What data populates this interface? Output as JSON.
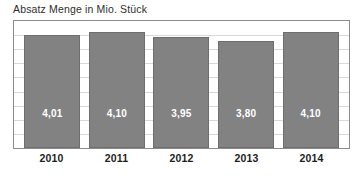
{
  "chart_data": {
    "type": "bar",
    "title": "Absatz Menge in Mio. Stück",
    "xlabel": "",
    "ylabel": "",
    "categories": [
      "2010",
      "2011",
      "2012",
      "2013",
      "2014"
    ],
    "values": [
      4.01,
      4.1,
      3.95,
      3.8,
      4.1
    ],
    "value_labels": [
      "4,01",
      "4,10",
      "3,95",
      "3,80",
      "4,10"
    ],
    "ylim": [
      0,
      4.5
    ],
    "grid": true,
    "gridline_count": 8,
    "legend": "none",
    "bar_color": "#828282",
    "bar_border_color": "#6e6e6e",
    "label_color": "#ffffff",
    "frame_color": "#8c8c8c",
    "gridline_color": "#d8d8d8",
    "title_color": "#2e2e2e",
    "axis_label_color": "#1d1d1d"
  }
}
